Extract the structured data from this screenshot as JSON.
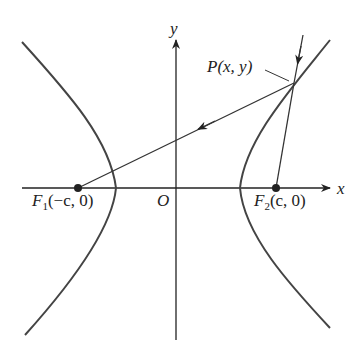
{
  "diagram": {
    "axes": {
      "x_label": "x",
      "y_label": "y",
      "origin_label": "O"
    },
    "points": {
      "P": {
        "name": "P",
        "coords": "(x, y)"
      },
      "F1": {
        "name": "F",
        "subscript": "1",
        "coords": "(−c, 0)"
      },
      "F2": {
        "name": "F",
        "subscript": "2",
        "coords": "(c, 0)"
      }
    },
    "colors": {
      "curve": "#444444",
      "line": "#333333",
      "point": "#222222",
      "background": "#ffffff"
    }
  }
}
